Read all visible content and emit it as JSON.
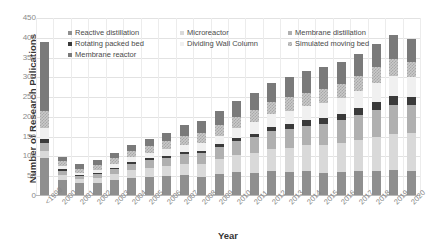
{
  "chart_data": {
    "type": "bar",
    "stacked": true,
    "title": "",
    "xlabel": "Year",
    "ylabel": "Number of Research Pulications",
    "ylim": [
      0,
      450
    ],
    "ytick_step": 50,
    "yticks": [
      450,
      400,
      350,
      300,
      250,
      200,
      150,
      100,
      50,
      0
    ],
    "grid": "horizontal-and-vertical",
    "legend_position": "top-inside",
    "categories": [
      "<1999",
      "2000",
      "2001",
      "2002",
      "2003",
      "2004",
      "2005",
      "2006",
      "2007",
      "2008",
      "2009",
      "2010",
      "2011",
      "2012",
      "2013",
      "2014",
      "2015",
      "2016",
      "2017",
      "2018",
      "2019",
      "2020"
    ],
    "series": [
      {
        "name": "Reactive distillation",
        "color": "#8f8f8f",
        "values": [
          95,
          40,
          32,
          34,
          40,
          46,
          48,
          50,
          52,
          48,
          55,
          60,
          58,
          62,
          60,
          62,
          58,
          60,
          62,
          64,
          66,
          64
        ]
      },
      {
        "name": "Microreactor",
        "color": "#d9d9d9",
        "values": [
          18,
          14,
          10,
          12,
          16,
          20,
          24,
          26,
          30,
          34,
          38,
          44,
          50,
          58,
          62,
          66,
          70,
          74,
          80,
          86,
          92,
          96
        ]
      },
      {
        "name": "Membrane distillation",
        "color": "#b0b0b0",
        "values": [
          22,
          10,
          8,
          10,
          12,
          16,
          18,
          20,
          24,
          26,
          30,
          34,
          40,
          44,
          48,
          50,
          54,
          58,
          62,
          68,
          72,
          70
        ]
      },
      {
        "name": "Rotating packed bed",
        "color": "#3a3a3a",
        "values": [
          8,
          4,
          3,
          3,
          4,
          5,
          5,
          6,
          6,
          7,
          8,
          9,
          10,
          11,
          12,
          13,
          14,
          15,
          18,
          20,
          22,
          20
        ]
      },
      {
        "name": "Dividing Wall Column",
        "color": "#f0f0f0",
        "values": [
          30,
          8,
          6,
          8,
          10,
          12,
          14,
          16,
          18,
          20,
          22,
          26,
          30,
          32,
          34,
          36,
          38,
          40,
          44,
          48,
          52,
          50
        ]
      },
      {
        "name": "Simulated moving bed",
        "color": "#c9c9c9",
        "values": [
          42,
          12,
          10,
          12,
          14,
          16,
          18,
          20,
          22,
          24,
          26,
          28,
          30,
          32,
          34,
          34,
          36,
          36,
          38,
          40,
          42,
          40
        ]
      },
      {
        "name": "Membrane reactor",
        "color": "#7a7a7a",
        "values": [
          175,
          12,
          11,
          11,
          14,
          15,
          18,
          22,
          28,
          31,
          36,
          39,
          42,
          46,
          50,
          54,
          56,
          57,
          56,
          58,
          60,
          56
        ]
      }
    ]
  },
  "legend": {
    "items": [
      {
        "label": "Reactive distillation"
      },
      {
        "label": "Microreactor"
      },
      {
        "label": "Membrane distillation"
      },
      {
        "label": "Rotating packed bed"
      },
      {
        "label": "Dividing Wall Column"
      },
      {
        "label": "Simulated moving bed"
      },
      {
        "label": "Membrane reactor"
      }
    ]
  }
}
